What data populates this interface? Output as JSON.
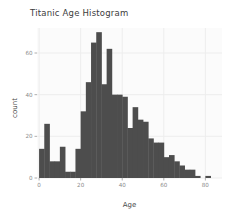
{
  "chart_data": {
    "type": "bar",
    "title": "Titanic Age Histogram",
    "xlabel": "Age",
    "ylabel": "count",
    "xlim": [
      -1,
      88
    ],
    "ylim": [
      0,
      72
    ],
    "grid": true,
    "legend": null,
    "bin_width": 2.5,
    "bar_color": "#4d4d4d",
    "panel_color": "#fbfbfb",
    "grid_color": "#ededed",
    "xticks": [
      0,
      20,
      40,
      60,
      80
    ],
    "xtick_labels": [
      "0",
      "20",
      "40",
      "60",
      "80"
    ],
    "yticks": [
      0,
      20,
      40,
      60
    ],
    "ytick_labels": [
      "0",
      "20",
      "40",
      "60"
    ],
    "bin_starts": [
      0,
      2.5,
      5,
      7.5,
      10,
      12.5,
      15,
      17.5,
      20,
      22.5,
      25,
      27.5,
      30,
      32.5,
      35,
      37.5,
      40,
      42.5,
      45,
      47.5,
      50,
      52.5,
      55,
      57.5,
      60,
      62.5,
      65,
      67.5,
      70,
      72.5,
      75,
      77.5,
      80
    ],
    "values": [
      14,
      26,
      8,
      8,
      15,
      3,
      3,
      14,
      32,
      46,
      65,
      70,
      45,
      62,
      40,
      40,
      39,
      24,
      34,
      28,
      27,
      19,
      17,
      17,
      10,
      11,
      8,
      6,
      4,
      4,
      1,
      0,
      1
    ],
    "categories": [
      "0-2.5",
      "2.5-5",
      "5-7.5",
      "7.5-10",
      "10-12.5",
      "12.5-15",
      "15-17.5",
      "17.5-20",
      "20-22.5",
      "22.5-25",
      "25-27.5",
      "27.5-30",
      "30-32.5",
      "32.5-35",
      "35-37.5",
      "37.5-40",
      "40-42.5",
      "42.5-45",
      "45-47.5",
      "47.5-50",
      "50-52.5",
      "52.5-55",
      "55-57.5",
      "57.5-60",
      "60-62.5",
      "62.5-65",
      "65-67.5",
      "67.5-70",
      "70-72.5",
      "72.5-75",
      "75-77.5",
      "77.5-80",
      "80-82.5"
    ]
  }
}
